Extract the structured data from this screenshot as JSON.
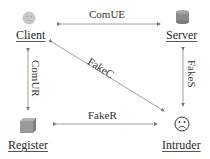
{
  "diagram": {
    "type": "network-attack-model",
    "nodes": [
      {
        "id": "client",
        "label": "Client",
        "icon": "neutral-face-icon"
      },
      {
        "id": "server",
        "label": "Server",
        "icon": "database-cylinder-icon"
      },
      {
        "id": "register",
        "label": "Register",
        "icon": "box-cube-icon"
      },
      {
        "id": "intruder",
        "label": "Intruder",
        "icon": "sad-face-icon"
      }
    ],
    "edges": [
      {
        "from": "client",
        "to": "server",
        "label": "ComUE",
        "bidirectional": true
      },
      {
        "from": "client",
        "to": "register",
        "label": "ComUR",
        "bidirectional": true
      },
      {
        "from": "server",
        "to": "intruder",
        "label": "FakeS",
        "bidirectional": true
      },
      {
        "from": "register",
        "to": "intruder",
        "label": "FakeR",
        "bidirectional": true
      },
      {
        "from": "client",
        "to": "intruder",
        "label": "FakeC",
        "bidirectional": true
      }
    ]
  },
  "colors": {
    "line": "#888888",
    "client_icon": "#c8c8c8",
    "server_icon": "#8a8a8a",
    "register_icon": "#9a9a9a",
    "intruder_icon": "#333333"
  }
}
